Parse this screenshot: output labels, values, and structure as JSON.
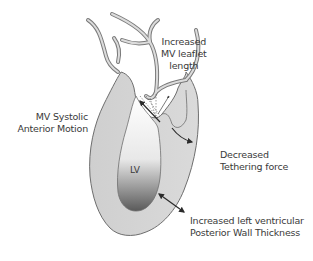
{
  "diagram": {
    "type": "anatomical-illustration",
    "chamber_label": "LV",
    "labels": {
      "leaflet": {
        "line1": "Increased",
        "line2": "MV leaflet",
        "line3": "length"
      },
      "sam": {
        "line1": "MV Systolic",
        "line2": "Anterior Motion"
      },
      "tethering": {
        "line1": "Decreased",
        "line2": "Tethering force"
      },
      "wall": {
        "line1": "Increased left ventricular",
        "line2": "Posterior Wall Thickness"
      }
    },
    "colors": {
      "wall_fill": "#d4d4d4",
      "outline": "#6e6e6e",
      "cavity_top": "#ffffff",
      "cavity_bottom": "#5a5a5a",
      "arrow": "#2a2a2a",
      "text": "#3a3a3a"
    }
  }
}
